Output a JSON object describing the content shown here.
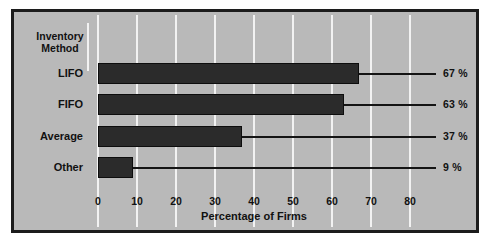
{
  "chart_data": {
    "type": "bar",
    "orientation": "horizontal",
    "title": "",
    "legend_title": "Inventory Method",
    "categories": [
      "LIFO",
      "FIFO",
      "Average",
      "Other"
    ],
    "values": [
      67,
      63,
      37,
      9
    ],
    "value_labels": [
      "67 %",
      "63 %",
      "37 %",
      "9 %"
    ],
    "xlabel": "Percentage of Firms",
    "ylabel": "Inventory Method",
    "xlim": [
      0,
      90
    ],
    "xticks": [
      0,
      10,
      20,
      30,
      40,
      50,
      60,
      70,
      80
    ],
    "xtick_labels": [
      "0",
      "10",
      "20",
      "30",
      "40",
      "50",
      "60",
      "70",
      "80"
    ],
    "grid": "vertical",
    "legend_position": "top-left",
    "colors": {
      "background": "#b9b9b9",
      "bar": "#2b2b2b",
      "gridline": "#f2f2f2",
      "frame": "#1c1c1c",
      "text": "#111111"
    }
  }
}
